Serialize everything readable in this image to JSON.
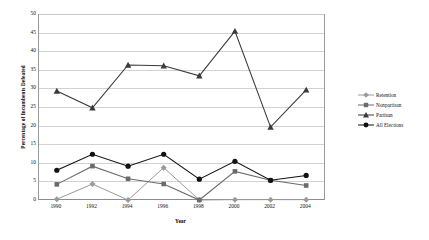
{
  "chart_data": {
    "type": "line",
    "title": "",
    "xlabel": "Year",
    "ylabel": "Percentage of Incumbents Defeated",
    "categories": [
      "1990",
      "1992",
      "1994",
      "1996",
      "1998",
      "2000",
      "2002",
      "2004"
    ],
    "ylim": [
      0,
      50
    ],
    "yticks": [
      0,
      5,
      10,
      15,
      20,
      25,
      30,
      35,
      40,
      45,
      50
    ],
    "grid": true,
    "legend_position": "right",
    "series": [
      {
        "name": "Retention",
        "marker": "diamond",
        "color": "#9a9a9a",
        "values": [
          0.2,
          4.3,
          0.0,
          8.7,
          0.0,
          0.1,
          0.1,
          0.1
        ]
      },
      {
        "name": "Nonpartisan",
        "marker": "square",
        "color": "#6b6b6b",
        "values": [
          4.2,
          9.1,
          5.7,
          4.3,
          0.0,
          7.7,
          5.3,
          3.9
        ]
      },
      {
        "name": "Partisan",
        "marker": "triangle",
        "color": "#3a3a3a",
        "values": [
          29.3,
          24.8,
          36.3,
          36.1,
          33.4,
          45.4,
          19.6,
          29.6
        ]
      },
      {
        "name": "All Elections",
        "marker": "circle",
        "color": "#111111",
        "values": [
          8.0,
          12.3,
          9.1,
          12.3,
          5.6,
          10.4,
          5.3,
          6.6
        ]
      }
    ]
  }
}
